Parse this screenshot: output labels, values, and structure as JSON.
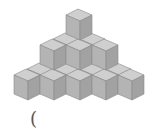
{
  "figure": {
    "layers": [
      {
        "level": 3,
        "front_cubes": 1,
        "back_cubes": 0
      },
      {
        "level": 2,
        "front_cubes": 3,
        "back_cubes": 2
      },
      {
        "level": 1,
        "front_cubes": 5,
        "back_cubes": 4
      }
    ],
    "colors": {
      "top": "#cfcfcf",
      "front": "#b4b4b4",
      "right": "#a2a2a2",
      "edge": "#8a8a8a"
    }
  },
  "answer_blank": {
    "text": "("
  }
}
